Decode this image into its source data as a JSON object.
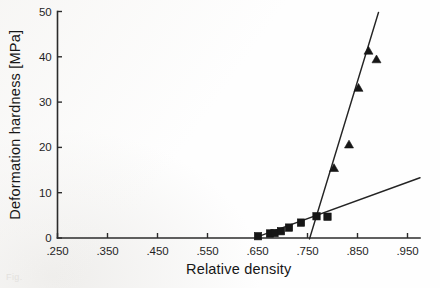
{
  "figure": {
    "caption_fragment": "Fig."
  },
  "chart_data": {
    "type": "scatter",
    "title": "",
    "xlabel": "Relative density",
    "ylabel": "Deformation hardness [MPa]",
    "xlim": [
      0.25,
      0.975
    ],
    "ylim": [
      0,
      50
    ],
    "grid": false,
    "legend": "none",
    "xticks": [
      0.25,
      0.35,
      0.45,
      0.55,
      0.65,
      0.75,
      0.85,
      0.95
    ],
    "xticklabels": [
      ".250",
      ".350",
      ".450",
      ".550",
      ".650",
      ".750",
      ".850",
      ".950"
    ],
    "yticks": [
      0,
      10,
      20,
      30,
      40,
      50
    ],
    "yticklabels": [
      "0",
      "10",
      "20",
      "30",
      "40",
      "50"
    ],
    "series": [
      {
        "name": "square-series",
        "marker": "square",
        "points": [
          {
            "x": 0.651,
            "y": 0.4
          },
          {
            "x": 0.675,
            "y": 1.0
          },
          {
            "x": 0.684,
            "y": 1.1
          },
          {
            "x": 0.697,
            "y": 1.5
          },
          {
            "x": 0.713,
            "y": 2.3
          },
          {
            "x": 0.737,
            "y": 3.4
          },
          {
            "x": 0.768,
            "y": 4.8
          },
          {
            "x": 0.79,
            "y": 4.7
          }
        ]
      },
      {
        "name": "triangle-series",
        "marker": "triangle",
        "points": [
          {
            "x": 0.803,
            "y": 15.4
          },
          {
            "x": 0.833,
            "y": 20.6
          },
          {
            "x": 0.852,
            "y": 33.1
          },
          {
            "x": 0.872,
            "y": 41.3
          },
          {
            "x": 0.888,
            "y": 39.4
          }
        ]
      }
    ],
    "fit_lines": [
      {
        "name": "shallow-fit-line",
        "x_start": 0.651,
        "y_start": 0.3,
        "x_end": 0.975,
        "y_end": 13.3
      },
      {
        "name": "steep-fit-line",
        "x_start": 0.754,
        "y_start": -0.2,
        "x_end": 0.892,
        "y_end": 49.8
      }
    ]
  }
}
